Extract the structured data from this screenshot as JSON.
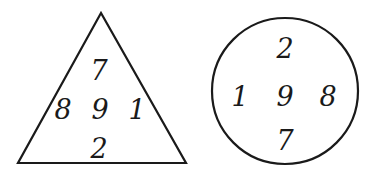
{
  "triangle": {
    "top": "7",
    "left": "8",
    "center": "9",
    "right": "1",
    "bottom": "2"
  },
  "circle": {
    "top": "2",
    "left": "1",
    "center": "9",
    "right": "8",
    "bottom": "7"
  },
  "colors": {
    "stroke": "#1a1a1a",
    "background": "#ffffff"
  }
}
